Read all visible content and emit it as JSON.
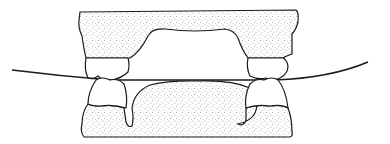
{
  "figure": {
    "colors": {
      "background": "#ffffff",
      "ink": "#1a1a1a",
      "stipple": "#555555"
    },
    "parts": [
      "upper-cast",
      "lower-cast",
      "upper-left-molar",
      "upper-right-molar",
      "lower-left-molar",
      "lower-right-molar",
      "occlusal-curve"
    ]
  }
}
